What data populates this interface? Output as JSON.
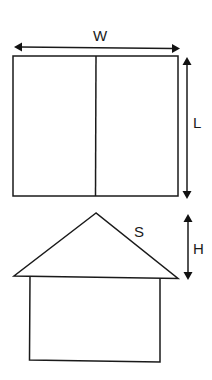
{
  "diagram": {
    "type": "geometry-figure",
    "stroke_color": "#1a1a1a",
    "background": "#ffffff",
    "top_view": {
      "shape": "rectangle-divided-vertically",
      "width_label": "W",
      "length_label": "L"
    },
    "front_view": {
      "shape": "house-pentagon",
      "slant_label": "S",
      "height_label": "H"
    }
  }
}
